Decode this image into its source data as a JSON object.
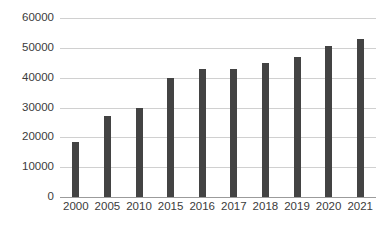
{
  "chart_data": {
    "type": "bar",
    "title": "",
    "subtitle": "",
    "xlabel": "",
    "ylabel": "",
    "categories": [
      "2000",
      "2005",
      "2010",
      "2015",
      "2016",
      "2017",
      "2018",
      "2019",
      "2020",
      "2021"
    ],
    "values": [
      18500,
      27000,
      30000,
      40000,
      43000,
      43000,
      45000,
      47000,
      50500,
      53000
    ],
    "ylim": [
      0,
      60000
    ],
    "ytick_labels": [
      "0",
      "10000",
      "20000",
      "30000",
      "40000",
      "50000",
      "60000"
    ],
    "ytick_values": [
      0,
      10000,
      20000,
      30000,
      40000,
      50000,
      60000
    ],
    "grid": true,
    "legend": false,
    "legend_position": "none",
    "bar_color": "#434343",
    "gridline_color": "#d0d0d0",
    "axis_color": "#9b9b9b",
    "background_color": "#ffffff",
    "text_color": "#3b3b3b"
  }
}
